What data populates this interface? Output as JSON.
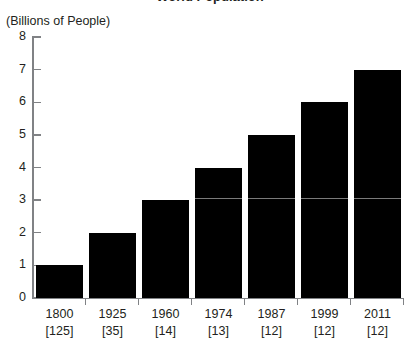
{
  "figure": {
    "title_cropped": "World Population",
    "y_axis_title": "(Billions of People)"
  },
  "chart_data": {
    "type": "bar",
    "title": "World Population",
    "xlabel": "",
    "ylabel": "(Billions of People)",
    "ylim": [
      0,
      8
    ],
    "yticks": [
      0,
      1,
      2,
      3,
      4,
      5,
      6,
      7,
      8
    ],
    "ytick_labels": [
      "0",
      "1",
      "2",
      "3",
      "4",
      "5",
      "6",
      "7",
      "8"
    ],
    "grid": false,
    "legend": "none",
    "bar_color": "#000000",
    "axis_color": "#808285",
    "categories": [
      "1800",
      "1925",
      "1960",
      "1974",
      "1987",
      "1999",
      "2011"
    ],
    "values": [
      1,
      2,
      3,
      4,
      5,
      6,
      7
    ],
    "annotations": {
      "label": "years elapsed to add the next billion",
      "bracket_values": [
        "[125]",
        "[35]",
        "[14]",
        "[13]",
        "[12]",
        "[12]",
        "[12]"
      ]
    },
    "points": [
      {
        "year": "1800",
        "population_billions": 1,
        "interval": "[125]"
      },
      {
        "year": "1925",
        "population_billions": 2,
        "interval": "[35]"
      },
      {
        "year": "1960",
        "population_billions": 3,
        "interval": "[14]"
      },
      {
        "year": "1974",
        "population_billions": 4,
        "interval": "[13]"
      },
      {
        "year": "1987",
        "population_billions": 5,
        "interval": "[12]"
      },
      {
        "year": "1999",
        "population_billions": 6,
        "interval": "[12]"
      },
      {
        "year": "2011",
        "population_billions": 7,
        "interval": "[12]"
      }
    ]
  }
}
